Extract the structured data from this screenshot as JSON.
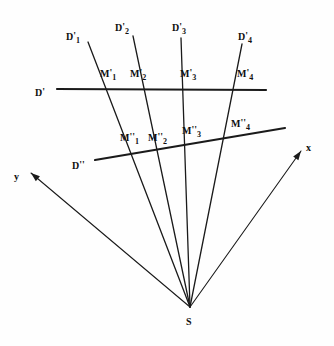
{
  "figure": {
    "background_color": "#fefefe",
    "ink_color": "#1a1a1a"
  },
  "chart_data": {
    "type": "scatter",
    "title": "",
    "xlabel": "x",
    "ylabel": "y",
    "grid": false,
    "legend": null,
    "annotations": [
      "D'",
      "D''",
      "S",
      "x",
      "y",
      "D'1",
      "D'2",
      "D'3",
      "D'4",
      "M'1",
      "M'2",
      "M'3",
      "M'4",
      "M''1",
      "M''2",
      "M''3",
      "M''4"
    ]
  },
  "center": {
    "name": "S",
    "label": "S",
    "x": 190,
    "y": 307,
    "label_x": 186,
    "label_y": 312
  },
  "axes": [
    {
      "id": "y-axis",
      "label": "y",
      "from_x": 190,
      "from_y": 307,
      "to_x": 31,
      "to_y": 173,
      "label_x": 14,
      "label_y": 167
    },
    {
      "id": "x-axis",
      "label": "x",
      "from_x": 190,
      "from_y": 307,
      "to_x": 301,
      "to_y": 151,
      "label_x": 306,
      "label_y": 138
    }
  ],
  "transversals": [
    {
      "id": "line-d-prime",
      "label": "D",
      "primes": "'",
      "from_x": 57,
      "from_y": 89,
      "to_x": 266,
      "to_y": 90,
      "label_x": 35,
      "label_y": 83
    },
    {
      "id": "line-d-double-prime",
      "label": "D",
      "primes": "''",
      "from_x": 95,
      "from_y": 160,
      "to_x": 285,
      "to_y": 128,
      "label_x": 72,
      "label_y": 156
    }
  ],
  "rays": [
    {
      "id": "ray-1",
      "label": "D",
      "primes": "'",
      "sub": "1",
      "top_x": 88,
      "top_y": 42,
      "label_x": 66,
      "label_y": 27,
      "m_prime": {
        "label": "M",
        "primes": "'",
        "sub": "1",
        "x": 111,
        "y": 89,
        "label_x": 100,
        "label_y": 64
      },
      "m_double": {
        "label": "M",
        "primes": "''",
        "sub": "1",
        "x": 136,
        "y": 153,
        "label_x": 120,
        "label_y": 128
      }
    },
    {
      "id": "ray-2",
      "label": "D",
      "primes": "'",
      "sub": "2",
      "top_x": 133,
      "top_y": 36,
      "label_x": 115,
      "label_y": 18,
      "m_prime": {
        "label": "M",
        "primes": "'",
        "sub": "2",
        "x": 143,
        "y": 89,
        "label_x": 130,
        "label_y": 64
      },
      "m_double": {
        "label": "M",
        "primes": "''",
        "sub": "2",
        "x": 158,
        "y": 149,
        "label_x": 148,
        "label_y": 128
      }
    },
    {
      "id": "ray-3",
      "label": "D",
      "primes": "'",
      "sub": "3",
      "top_x": 181,
      "top_y": 38,
      "label_x": 172,
      "label_y": 18,
      "m_prime": {
        "label": "M",
        "primes": "'",
        "sub": "3",
        "x": 184,
        "y": 89,
        "label_x": 180,
        "label_y": 64
      },
      "m_double": {
        "label": "M",
        "primes": "''",
        "sub": "3",
        "x": 187,
        "y": 144,
        "label_x": 182,
        "label_y": 121
      }
    },
    {
      "id": "ray-4",
      "label": "D",
      "primes": "'",
      "sub": "4",
      "top_x": 242,
      "top_y": 44,
      "label_x": 238,
      "label_y": 27,
      "m_prime": {
        "label": "M",
        "primes": "'",
        "sub": "4",
        "x": 231,
        "y": 89,
        "label_x": 237,
        "label_y": 64
      },
      "m_double": {
        "label": "M",
        "primes": "''",
        "sub": "4",
        "x": 218,
        "y": 139,
        "label_x": 231,
        "label_y": 114
      }
    }
  ]
}
